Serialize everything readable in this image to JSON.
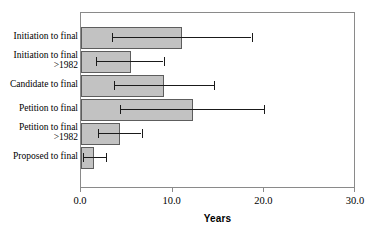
{
  "chart_data": {
    "type": "bar",
    "orientation": "horizontal",
    "title": "",
    "xlabel": "Years",
    "ylabel": "",
    "xlim": [
      0.0,
      30.0
    ],
    "xticks": [
      "0.0",
      "10.0",
      "20.0",
      "30.0"
    ],
    "xtick_values": [
      0.0,
      10.0,
      20.0,
      30.0
    ],
    "grid": false,
    "legend": false,
    "bar_color": "#c2c2c2",
    "bar_edge_color": "#5d5d5d",
    "error_bar_color": "#1a1a1a",
    "axis_color": "#8a8a8a",
    "categories": [
      "Initiation to final",
      "Initiation to final\n>1982",
      "Candidate to final",
      "Petition to final",
      "Petition to final\n>1982",
      "Proposed to final"
    ],
    "values": [
      11.0,
      5.4,
      9.0,
      12.2,
      4.2,
      1.4
    ],
    "error_low": [
      3.4,
      1.6,
      3.6,
      4.3,
      1.9,
      0.2
    ],
    "error_high": [
      18.6,
      9.0,
      14.5,
      20.0,
      6.6,
      2.7
    ],
    "bars": [
      {
        "category": "Initiation to final",
        "value": 11.0,
        "error_low": 3.4,
        "error_high": 18.6
      },
      {
        "category": "Initiation to final >1982",
        "value": 5.4,
        "error_low": 1.6,
        "error_high": 9.0
      },
      {
        "category": "Candidate to final",
        "value": 9.0,
        "error_low": 3.6,
        "error_high": 14.5
      },
      {
        "category": "Petition to final",
        "value": 12.2,
        "error_low": 4.3,
        "error_high": 20.0
      },
      {
        "category": "Petition to final >1982",
        "value": 4.2,
        "error_low": 1.9,
        "error_high": 6.6
      },
      {
        "category": "Proposed to final",
        "value": 1.4,
        "error_low": 0.2,
        "error_high": 2.7
      }
    ]
  },
  "axis": {
    "x_title": "Years",
    "tick_0": "0.0",
    "tick_1": "10.0",
    "tick_2": "20.0",
    "tick_3": "30.0"
  },
  "labels": {
    "row_0": "Initiation to final",
    "row_1": "Initiation to final\n>1982",
    "row_2": "Candidate to final",
    "row_3": "Petition to final",
    "row_4": "Petition to final\n>1982",
    "row_5": "Proposed to final"
  }
}
